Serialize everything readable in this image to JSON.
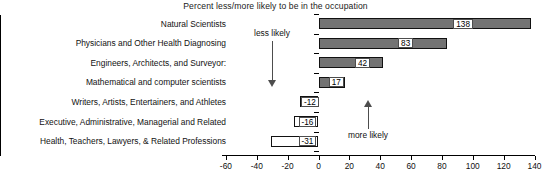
{
  "chart_data": {
    "type": "bar",
    "orientation": "horizontal",
    "title": "Percent less/more likely to be in the occupation",
    "xlabel": "",
    "ylabel": "",
    "xlim": [
      -60,
      140
    ],
    "xticks": [
      -60,
      -40,
      -20,
      0,
      20,
      40,
      60,
      80,
      100,
      120,
      140
    ],
    "xtick_labels": [
      "-60",
      "-40",
      "-20",
      "0",
      "20",
      "40",
      "60",
      "80",
      "100",
      "120",
      "140"
    ],
    "grid": false,
    "legend": null,
    "categories": [
      "Natural Scientists",
      "Physicians and Other Health Diagnosing",
      "Engineers, Architects, and Surveyor:",
      "Mathematical and computer scientists",
      "Writers, Artists, Entertainers, and Athletes",
      "Executive, Administrative, Managerial and Related",
      "Health, Teachers, Lawyers, & Related Professions"
    ],
    "values": [
      138,
      83,
      42,
      17,
      -12,
      -16,
      -31
    ],
    "value_labels": [
      "138",
      "83",
      "42",
      "17",
      "-12",
      "-16",
      "-31"
    ],
    "bar_colors": [
      "#737373",
      "#737373",
      "#737373",
      "#737373",
      "#ffffff",
      "#ffffff",
      "#ffffff"
    ],
    "annotations": [
      {
        "text": "less likely",
        "direction": "down"
      },
      {
        "text": "more likely",
        "direction": "up"
      }
    ]
  },
  "colors": {
    "positive_fill": "#737373",
    "negative_fill": "#ffffff",
    "outline": "#111111",
    "background": "#ffffff",
    "annotation": "#4d4d4d"
  }
}
